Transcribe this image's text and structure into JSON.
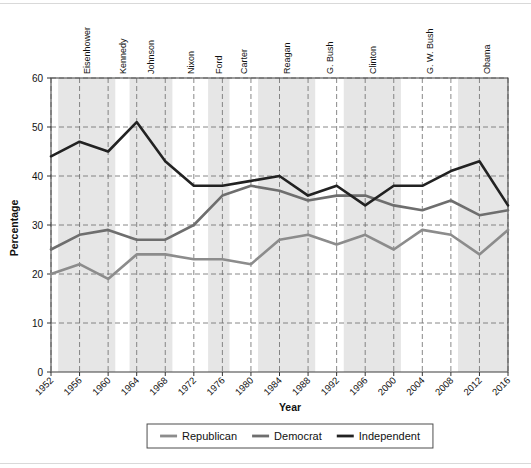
{
  "chart_data": {
    "type": "line",
    "title": "",
    "xlabel": "Year",
    "ylabel": "Percentage",
    "xlim": [
      1952,
      2016
    ],
    "ylim": [
      0,
      60
    ],
    "ytick_step": 10,
    "grid": true,
    "legend_position": "bottom",
    "x": [
      1952,
      1956,
      1960,
      1964,
      1968,
      1972,
      1976,
      1980,
      1984,
      1988,
      1992,
      1996,
      2000,
      2004,
      2008,
      2012,
      2016
    ],
    "yticks": [
      0,
      10,
      20,
      30,
      40,
      50,
      60
    ],
    "xticklabels": [
      "1952",
      "1956",
      "1960",
      "1964",
      "1968",
      "1972",
      "1976",
      "1980",
      "1984",
      "1988",
      "1992",
      "1996",
      "2000",
      "2004",
      "2008",
      "2012",
      "2016"
    ],
    "series": [
      {
        "name": "Republican",
        "color": "#8c8c8c",
        "values": [
          20,
          22,
          19,
          24,
          24,
          23,
          23,
          22,
          27,
          28,
          26,
          28,
          25,
          29,
          28,
          24,
          29
        ]
      },
      {
        "name": "Democrat",
        "color": "#6e6e6e",
        "values": [
          25,
          28,
          29,
          27,
          27,
          30,
          36,
          38,
          37,
          35,
          36,
          36,
          34,
          33,
          35,
          32,
          33
        ]
      },
      {
        "name": "Independent",
        "color": "#222222",
        "values": [
          44,
          47,
          45,
          51,
          43,
          38,
          38,
          39,
          40,
          36,
          38,
          34,
          38,
          38,
          41,
          43,
          34
        ]
      }
    ],
    "presidents": [
      {
        "name": "Eisenhower",
        "start": 1953,
        "end": 1961
      },
      {
        "name": "Kennedy",
        "start": 1961,
        "end": 1963
      },
      {
        "name": "Johnson",
        "start": 1963,
        "end": 1969
      },
      {
        "name": "Nixon",
        "start": 1969,
        "end": 1974
      },
      {
        "name": "Ford",
        "start": 1974,
        "end": 1977
      },
      {
        "name": "Carter",
        "start": 1977,
        "end": 1981
      },
      {
        "name": "Reagan",
        "start": 1981,
        "end": 1989
      },
      {
        "name": "G. Bush",
        "start": 1989,
        "end": 1993
      },
      {
        "name": "Clinton",
        "start": 1993,
        "end": 2001
      },
      {
        "name": "G. W. Bush",
        "start": 2001,
        "end": 2009
      },
      {
        "name": "Obama",
        "start": 2009,
        "end": 2017
      }
    ],
    "shaded_bands": [
      {
        "start": 1953,
        "end": 1961
      },
      {
        "start": 1963,
        "end": 1969
      },
      {
        "start": 1974,
        "end": 1977
      },
      {
        "start": 1981,
        "end": 1989
      },
      {
        "start": 1993,
        "end": 2001
      },
      {
        "start": 2009,
        "end": 2017
      }
    ]
  },
  "axes": {
    "ylabel": "Percentage",
    "xlabel": "Year",
    "ytick_0": "0",
    "ytick_10": "10",
    "ytick_20": "20",
    "ytick_30": "30",
    "ytick_40": "40",
    "ytick_50": "50",
    "ytick_60": "60"
  },
  "legend": {
    "items": [
      {
        "label": "Republican",
        "color": "#8c8c8c"
      },
      {
        "label": "Democrat",
        "color": "#6e6e6e"
      },
      {
        "label": "Independent",
        "color": "#222222"
      }
    ]
  },
  "presidents_labels": [
    "Eisenhower",
    "Kennedy",
    "Johnson",
    "Nixon",
    "Ford",
    "Carter",
    "Reagan",
    "G. Bush",
    "Clinton",
    "G. W. Bush",
    "Obama"
  ]
}
